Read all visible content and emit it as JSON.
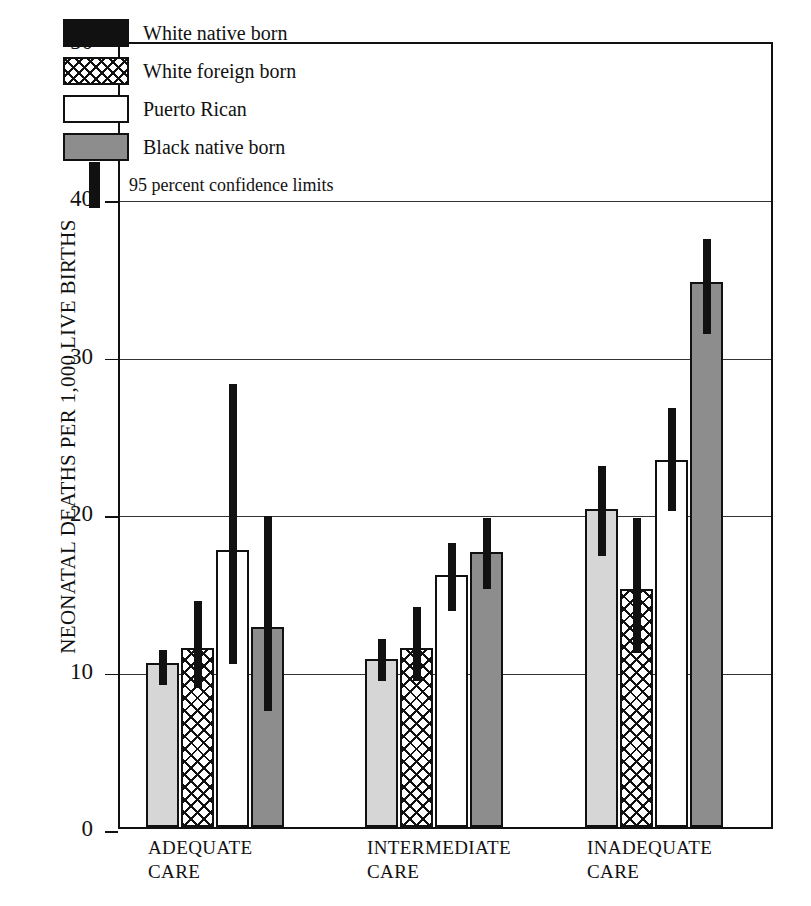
{
  "chart_data": {
    "type": "bar",
    "title": "",
    "xlabel": "",
    "ylabel": "NEONATAL DEATHS PER 1,000 LIVE BIRTHS",
    "ylim": [
      0,
      50
    ],
    "yticks": [
      0,
      10,
      20,
      30,
      40,
      50
    ],
    "ytick_labels": [
      "0",
      "10",
      "20",
      "30",
      "40",
      "50"
    ],
    "grid": true,
    "grid_axis": "y",
    "legend_position": "upper-left-inside",
    "categories": [
      "ADEQUATE CARE",
      "INTERMEDIATE CARE",
      "INADEQUATE CARE"
    ],
    "category_lines": [
      [
        "ADEQUATE",
        "CARE"
      ],
      [
        "INTERMEDIATE",
        "CARE"
      ],
      [
        "INADEQUATE",
        "CARE"
      ]
    ],
    "series": [
      {
        "name": "White native born",
        "fill": "solid-black",
        "color": "#d6d6d6",
        "values": [
          10.4,
          10.7,
          20.2
        ],
        "ci_low": [
          9.3,
          9.5,
          17.5
        ],
        "ci_high": [
          11.5,
          12.2,
          23.2
        ]
      },
      {
        "name": "White foreign born",
        "fill": "crosshatch",
        "color": "#ffffff",
        "values": [
          11.4,
          11.4,
          15.1
        ],
        "ci_low": [
          9.1,
          9.5,
          11.3
        ],
        "ci_high": [
          14.6,
          14.2,
          19.9
        ]
      },
      {
        "name": "Puerto Rican",
        "fill": "white",
        "color": "#ffffff",
        "values": [
          17.6,
          16.0,
          23.3
        ],
        "ci_low": [
          10.6,
          14.0,
          20.3
        ],
        "ci_high": [
          28.4,
          18.3,
          26.9
        ]
      },
      {
        "name": "Black native born",
        "fill": "gray",
        "color": "#8d8d8d",
        "values": [
          12.7,
          17.5,
          34.6
        ],
        "ci_low": [
          7.6,
          15.4,
          31.6
        ],
        "ci_high": [
          20.0,
          19.9,
          37.6
        ]
      }
    ],
    "error_bar_label": "95 percent confidence limits"
  },
  "legend": {
    "items": [
      {
        "label": "White native born"
      },
      {
        "label": "White foreign born"
      },
      {
        "label": "Puerto Rican"
      },
      {
        "label": "Black native born"
      },
      {
        "label": "95 percent confidence limits"
      }
    ]
  }
}
